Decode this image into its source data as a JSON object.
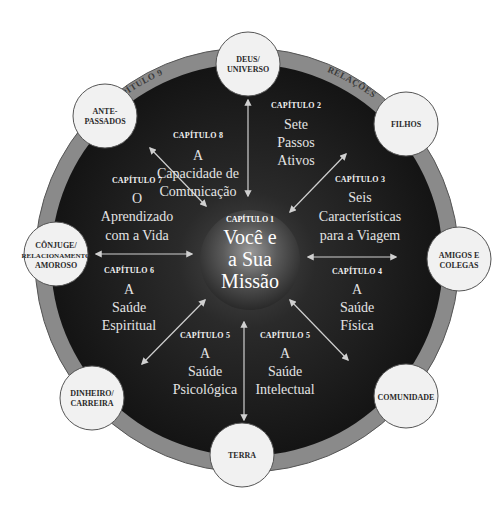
{
  "colors": {
    "background": "#ffffff",
    "outer_ring": "#8a8a8a",
    "inner_disk": "#1c1c1c",
    "satellite_fill": "#f1f1f1",
    "satellite_stroke": "#555555",
    "arrow": "#d0d0d0"
  },
  "ring": {
    "left_label": "CAPÍTULO 9",
    "right_label": "RELAÇÕES"
  },
  "center": {
    "chapter": "CAPÍTULO 1",
    "lines": [
      "Você e",
      "a Sua",
      "Missão"
    ]
  },
  "chapters": [
    {
      "id": "ch8",
      "chapter": "CAPÍTULO 8",
      "lines": [
        "A",
        "Capacidade de",
        "Comunicação"
      ]
    },
    {
      "id": "ch2",
      "chapter": "CAPÍTULO 2",
      "lines": [
        "Sete",
        "Passos",
        "Ativos"
      ]
    },
    {
      "id": "ch3",
      "chapter": "CAPÍTULO 3",
      "lines": [
        "Seis",
        "Características",
        "para a Viagem"
      ]
    },
    {
      "id": "ch4",
      "chapter": "CAPÍTULO 4",
      "lines": [
        "A",
        "Saúde",
        "Física"
      ]
    },
    {
      "id": "ch5b",
      "chapter": "CAPÍTULO 5",
      "lines": [
        "A",
        "Saúde",
        "Intelectual"
      ]
    },
    {
      "id": "ch5a",
      "chapter": "CAPÍTULO 5",
      "lines": [
        "A",
        "Saúde",
        "Psicológica"
      ]
    },
    {
      "id": "ch6",
      "chapter": "CAPÍTULO 6",
      "lines": [
        "A",
        "Saúde",
        "Espiritual"
      ]
    },
    {
      "id": "ch7",
      "chapter": "CAPÍTULO 7",
      "lines": [
        "O",
        "Aprendizado",
        "com a Vida"
      ]
    }
  ],
  "satellites": [
    {
      "id": "deus",
      "lines": [
        "DEUS/",
        "UNIVERSO"
      ]
    },
    {
      "id": "filhos",
      "lines": [
        "FILHOS"
      ]
    },
    {
      "id": "amigos",
      "lines": [
        "AMIGOS E",
        "COLEGAS"
      ]
    },
    {
      "id": "comunidade",
      "lines": [
        "COMUNIDADE"
      ]
    },
    {
      "id": "terra",
      "lines": [
        "TERRA"
      ]
    },
    {
      "id": "dinheiro",
      "lines": [
        "DINHEIRO/",
        "CARREIRA"
      ]
    },
    {
      "id": "conjuge",
      "lines": [
        "CÔNJUGE/",
        "RELACIONAMENTO",
        "AMOROSO"
      ]
    },
    {
      "id": "antepassados",
      "lines": [
        "ANTE-",
        "PASSADOS"
      ]
    }
  ]
}
